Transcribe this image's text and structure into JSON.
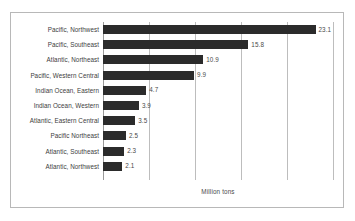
{
  "chart_data": {
    "type": "bar",
    "orientation": "horizontal",
    "title": "",
    "subtitle": "",
    "xlabel": "Million tons",
    "ylabel": "",
    "xlim": [
      0,
      25
    ],
    "xticks": [
      0,
      5,
      10,
      15,
      20,
      25
    ],
    "grid": true,
    "legend": false,
    "legend_position": "none",
    "categories": [
      "Pacific, Northwest",
      "Pacific, Southeast",
      "Atlantic, Northeast",
      "Pacific, Western Central",
      "Indian Ocean, Eastern",
      "Indian Ocean, Western",
      "Atlantic, Eastern Central",
      "Pacific Northeast",
      "Atlantic, Southeast",
      "Atlantic, Northwest"
    ],
    "values": [
      23.1,
      15.8,
      10.9,
      9.9,
      4.7,
      3.9,
      3.5,
      2.5,
      2.3,
      2.1
    ],
    "value_labels": [
      "23.1",
      "15.8",
      "10.9",
      "9.9",
      "4.7",
      "3.9",
      "3.5",
      "2.5",
      "2.3",
      "2.1"
    ],
    "bar_color": "#2b2b2b",
    "gridline_color": "#bdbdbd",
    "frame_color": "#b8b8b8",
    "text_color": "#3d3d3d"
  }
}
